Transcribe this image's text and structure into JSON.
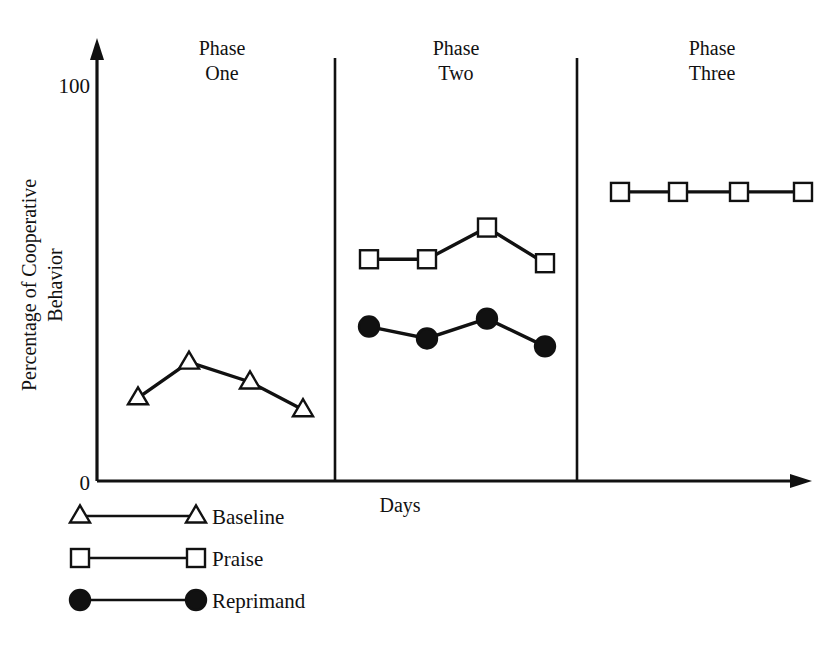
{
  "chart_data": {
    "type": "line",
    "title": "",
    "xlabel": "Days",
    "ylabel": "Percentage of Cooperative Behavior",
    "ylabel_lines": [
      "Percentage of Cooperative",
      "Behavior"
    ],
    "ylim": [
      0,
      110
    ],
    "ytick_labels": [
      "0",
      "100"
    ],
    "ytick_values": [
      0,
      100
    ],
    "grid": false,
    "legend_position": "below-axes-left",
    "x_axis_arrow": true,
    "y_axis_arrow": true,
    "phases": [
      {
        "name": "Phase One",
        "line1": "Phase",
        "line2": "One"
      },
      {
        "name": "Phase Two",
        "line1": "Phase",
        "line2": "Two"
      },
      {
        "name": "Phase Three",
        "line1": "Phase",
        "line2": "Three"
      }
    ],
    "series": [
      {
        "name": "Baseline",
        "marker": "triangle-open",
        "phase": "Phase One",
        "x": [
          1,
          2,
          3,
          4
        ],
        "values": [
          21,
          30,
          25,
          18
        ]
      },
      {
        "name": "Praise",
        "marker": "square-open",
        "segments": [
          {
            "phase": "Phase Two",
            "x": [
              5,
              6,
              7,
              8
            ],
            "values": [
              56,
              56,
              64,
              55
            ]
          },
          {
            "phase": "Phase Three",
            "x": [
              9,
              10,
              11,
              12
            ],
            "values": [
              73,
              73,
              73,
              73
            ]
          }
        ]
      },
      {
        "name": "Reprimand",
        "marker": "circle-filled",
        "segments": [
          {
            "phase": "Phase Two",
            "x": [
              5,
              6,
              7,
              8
            ],
            "values": [
              39,
              36,
              41,
              34
            ]
          }
        ]
      }
    ],
    "legend": [
      {
        "label": "Baseline",
        "marker": "triangle-open"
      },
      {
        "label": "Praise",
        "marker": "square-open"
      },
      {
        "label": "Reprimand",
        "marker": "circle-filled"
      }
    ],
    "colors": {
      "ink": "#111111",
      "background": "#ffffff",
      "marker_fill_open": "#ffffff",
      "marker_fill_solid": "#111111"
    }
  }
}
